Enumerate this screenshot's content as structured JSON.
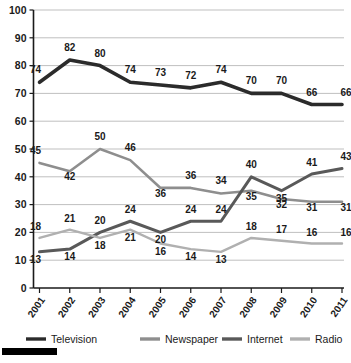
{
  "chart_data": {
    "type": "line",
    "title": "",
    "subtitle": "",
    "xlabel": "",
    "ylabel": "",
    "categories": [
      "2001",
      "2002",
      "2003",
      "2004",
      "2005",
      "2006",
      "2007",
      "2008",
      "2009",
      "2010",
      "2011"
    ],
    "x": [
      2001,
      2002,
      2003,
      2004,
      2005,
      2006,
      2007,
      2008,
      2009,
      2010,
      2011
    ],
    "ylim": [
      0,
      100
    ],
    "ytick_step": 10,
    "yticks": [
      0,
      10,
      20,
      30,
      40,
      50,
      60,
      70,
      80,
      90,
      100
    ],
    "grid": true,
    "grid_axis": "y",
    "legend_position": "bottom",
    "data_labels": true,
    "series": [
      {
        "name": "Television",
        "color": "#2b2b2b",
        "values": [
          74,
          82,
          80,
          74,
          73,
          72,
          74,
          70,
          70,
          66,
          66
        ]
      },
      {
        "name": "Newspaper",
        "color": "#8e8e8e",
        "values": [
          45,
          42,
          50,
          46,
          36,
          36,
          34,
          35,
          32,
          31,
          31
        ]
      },
      {
        "name": "Internet",
        "color": "#595959",
        "values": [
          13,
          14,
          20,
          24,
          20,
          24,
          24,
          40,
          35,
          41,
          43
        ]
      },
      {
        "name": "Radio",
        "color": "#b0b0b0",
        "values": [
          18,
          21,
          18,
          21,
          16,
          14,
          13,
          18,
          17,
          16,
          16
        ]
      }
    ]
  },
  "legend": {
    "items": [
      {
        "label": "Television",
        "color": "#2b2b2b"
      },
      {
        "label": "Newspaper",
        "color": "#8e8e8e"
      },
      {
        "label": "Internet",
        "color": "#595959"
      },
      {
        "label": "Radio",
        "color": "#b0b0b0"
      }
    ]
  },
  "axes": {
    "y_labels": [
      "100",
      "90",
      "80",
      "70",
      "60",
      "50",
      "40",
      "30",
      "20",
      "10",
      "0"
    ],
    "x_labels": [
      "2001",
      "2002",
      "2003",
      "2004",
      "2005",
      "2006",
      "2007",
      "2008",
      "2009",
      "2010",
      "2011"
    ]
  },
  "colors": {
    "background": "#ffffff",
    "grid": "#b8b8b8",
    "axis": "#1a1a1a",
    "text": "#1a1a1a",
    "footer_bar": "#000000"
  }
}
